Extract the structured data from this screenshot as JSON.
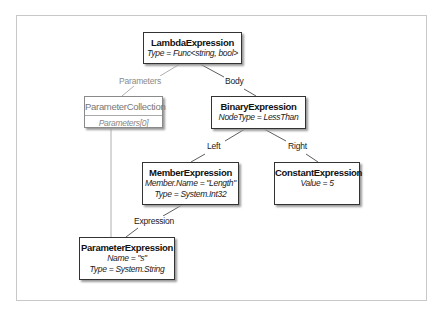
{
  "diagram": {
    "type": "expression-tree",
    "nodes": {
      "lambda": {
        "title": "LambdaExpression",
        "props": [
          "Type = Func<string, bool>"
        ]
      },
      "param_collection": {
        "title": "ParameterCollection",
        "props": [
          "Parameters[0]"
        ]
      },
      "binary": {
        "title": "BinaryExpression",
        "props": [
          "NodeType = LessThan"
        ]
      },
      "member": {
        "title": "MemberExpression",
        "props": [
          "Member.Name = \"Length\"",
          "Type = System.Int32"
        ]
      },
      "constant": {
        "title": "ConstantExpression",
        "props": [
          "Value = 5"
        ]
      },
      "parameter": {
        "title": "ParameterExpression",
        "props": [
          "Name = \"s\"",
          "Type = System.String"
        ]
      }
    },
    "edges": {
      "parameters": "Parameters",
      "body": "Body",
      "left": "Left",
      "right": "Right",
      "expression": "Expression"
    }
  },
  "colors": {
    "border": "#333333",
    "muted": "#8a8a8a",
    "frame": "#c8c8c8"
  }
}
